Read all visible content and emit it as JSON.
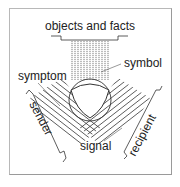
{
  "diagram": {
    "type": "semiotic-triangle",
    "labels": {
      "top": "objects and facts",
      "symbol": "symbol",
      "symptom": "symptom",
      "sender": "sender",
      "recipient": "recipient",
      "signal": "signal"
    },
    "colors": {
      "line": "#333333",
      "text": "#222222",
      "frame": "#b0b0b0",
      "background": "#ffffff"
    }
  }
}
